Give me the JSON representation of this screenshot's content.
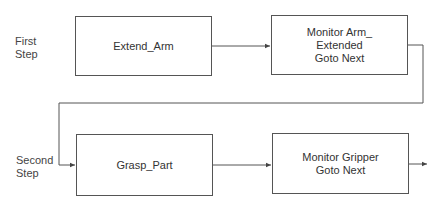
{
  "diagram": {
    "type": "flowchart",
    "steps": [
      {
        "label_lines": [
          "First",
          "Step"
        ],
        "boxes": [
          {
            "lines": [
              "Extend_Arm"
            ]
          },
          {
            "lines": [
              "Monitor Arm_",
              "Extended",
              "Goto Next"
            ]
          }
        ]
      },
      {
        "label_lines": [
          "Second",
          "Step"
        ],
        "boxes": [
          {
            "lines": [
              "Grasp_Part"
            ]
          },
          {
            "lines": [
              "Monitor Gripper",
              "Goto Next"
            ]
          }
        ]
      }
    ],
    "colors": {
      "stroke": "#555555",
      "text": "#333333",
      "background": "#ffffff"
    }
  }
}
